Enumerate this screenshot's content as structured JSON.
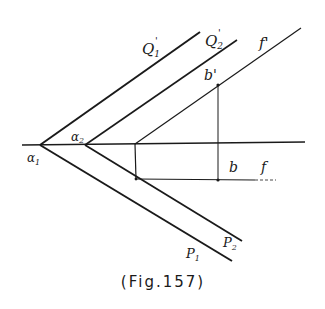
{
  "figure": {
    "caption": "(Fig.157)",
    "labels": {
      "Q1_prime": "Q",
      "Q1_prime_sub": "1",
      "Q2_prime": "Q",
      "Q2_prime_sub": "2",
      "prime_mark": "'",
      "f_prime": "f'",
      "b_prime": "b'",
      "b": "b",
      "f": "f",
      "alpha1": "α",
      "alpha1_sub": "1",
      "alpha2": "α",
      "alpha2_sub": "2",
      "P1": "P",
      "P1_sub": "1",
      "P2": "P",
      "P2_sub": "2"
    },
    "colors": {
      "ink": "#1a1a1a",
      "background": "#ffffff"
    }
  }
}
